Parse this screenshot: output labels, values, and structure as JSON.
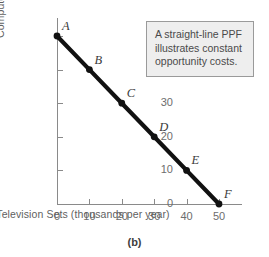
{
  "figure": {
    "caption": "(b)"
  },
  "callout": {
    "text": "A straight-line PPF illustrates constant opportunity costs."
  },
  "chart_data": {
    "type": "line",
    "title": "",
    "subtitle": "",
    "xlabel": "Television Sets (thousands per year)",
    "ylabel": "Computers (thousands per year)",
    "xlim": [
      0,
      50
    ],
    "ylim": [
      0,
      50
    ],
    "xticks": [
      0,
      10,
      20,
      30,
      40,
      50
    ],
    "yticks": [
      0,
      10,
      20,
      30,
      40,
      50
    ],
    "xtick_labels": [
      "0",
      "10",
      "20",
      "30",
      "40",
      "50"
    ],
    "ytick_labels": [
      "0",
      "10",
      "20",
      "30",
      "40",
      "50"
    ],
    "grid": false,
    "legend": false,
    "line_color": "#111111",
    "marker_color": "#111111",
    "series": [
      {
        "name": "PPF",
        "x": [
          0,
          10,
          20,
          30,
          40,
          50
        ],
        "values": [
          50,
          40,
          30,
          20,
          10,
          0
        ],
        "point_labels": [
          "A",
          "B",
          "C",
          "D",
          "E",
          "F"
        ]
      }
    ],
    "annotations": [
      "A straight-line PPF illustrates constant opportunity costs."
    ]
  }
}
